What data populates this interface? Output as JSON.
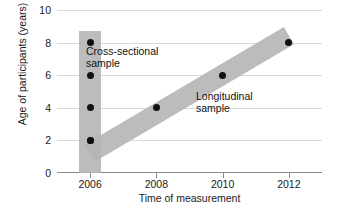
{
  "chart_data": {
    "type": "scatter",
    "title": "",
    "xlabel": "Time of measurement",
    "ylabel": "Age of participants (years)",
    "xlim": [
      2005,
      2013
    ],
    "ylim": [
      0,
      10
    ],
    "xticks": [
      "2006",
      "2008",
      "2010",
      "2012"
    ],
    "xtick_values": [
      2006,
      2008,
      2010,
      2012
    ],
    "yticks": [
      "0",
      "2",
      "4",
      "6",
      "8",
      "10"
    ],
    "ytick_values": [
      0,
      2,
      4,
      6,
      8,
      10
    ],
    "grid": true,
    "legend": "none",
    "series": [
      {
        "name": "Cross-sectional sample",
        "points": [
          {
            "x": 2006,
            "y": 8
          },
          {
            "x": 2006,
            "y": 6
          },
          {
            "x": 2006,
            "y": 4
          },
          {
            "x": 2006,
            "y": 2
          }
        ]
      },
      {
        "name": "Longitudinal sample",
        "points": [
          {
            "x": 2006,
            "y": 2
          },
          {
            "x": 2008,
            "y": 4
          },
          {
            "x": 2010,
            "y": 6
          },
          {
            "x": 2012,
            "y": 8
          }
        ]
      }
    ],
    "annotations": [
      {
        "text": "Cross-sectional\nsample",
        "x": 2006.4,
        "y": 7.3
      },
      {
        "text": "Longitudinal\nsample",
        "x": 2009.3,
        "y": 4.9
      }
    ],
    "bands": [
      {
        "name": "cross-sectional-band",
        "orientation": "vertical",
        "x": 2006,
        "y_from": 0,
        "y_to": 8.7,
        "color": "#b5b5b5"
      },
      {
        "name": "longitudinal-band",
        "orientation": "diagonal",
        "from": {
          "x": 2006,
          "y": 1.2
        },
        "to": {
          "x": 2012,
          "y": 8.4
        },
        "color": "#b5b5b5"
      }
    ],
    "colors": {
      "point": "#111111",
      "band": "#b5b5b5",
      "gridline": "#d9d9d9",
      "axis": "#8a8a8a",
      "background": "#ffffff",
      "text": "#1a1a1a"
    }
  }
}
